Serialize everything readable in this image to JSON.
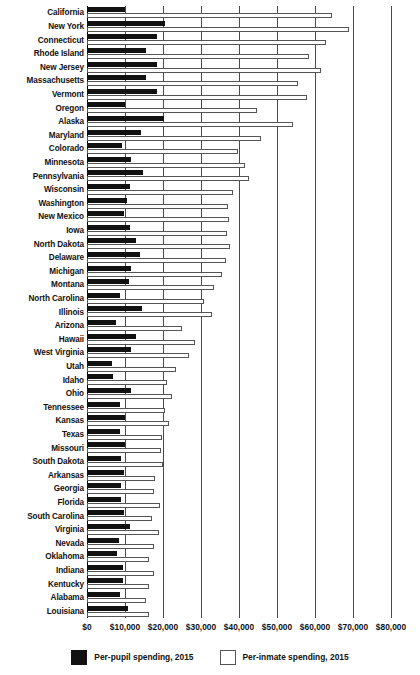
{
  "chart_data": {
    "type": "bar",
    "orientation": "horizontal",
    "title": "",
    "xlabel": "",
    "ylabel": "",
    "xlim": [
      0,
      80000
    ],
    "xticks": [
      0,
      10000,
      20000,
      30000,
      40000,
      50000,
      60000,
      70000,
      80000
    ],
    "xtick_labels": [
      "$0",
      "$10,000",
      "$20,000",
      "$30,000",
      "$40,000",
      "$50,000",
      "$60,000",
      "$70,000",
      "$80,000"
    ],
    "grid": true,
    "legend_position": "bottom",
    "colors": {
      "pupil": "#111111",
      "inmate": "#ffffff",
      "outline": "#555555",
      "grid": "#4a4a4a"
    },
    "series": [
      {
        "name": "Per-pupil spending, 2015",
        "key": "pupil"
      },
      {
        "name": "Per-inmate spending, 2015",
        "key": "inmate"
      }
    ],
    "categories": [
      "California",
      "New York",
      "Connecticut",
      "Rhode Island",
      "New Jersey",
      "Massachusetts",
      "Vermont",
      "Oregon",
      "Alaska",
      "Maryland",
      "Colorado",
      "Minnesota",
      "Pennsylvania",
      "Wisconsin",
      "Washington",
      "New Mexico",
      "Iowa",
      "North Dakota",
      "Delaware",
      "Michigan",
      "Montana",
      "North Carolina",
      "Illinois",
      "Arizona",
      "Hawaii",
      "West Virginia",
      "Utah",
      "Idaho",
      "Ohio",
      "Tennessee",
      "Kansas",
      "Texas",
      "Missouri",
      "South Dakota",
      "Arkansas",
      "Georgia",
      "Florida",
      "South Carolina",
      "Virginia",
      "Nevada",
      "Oklahoma",
      "Indiana",
      "Kentucky",
      "Alabama",
      "Louisiana"
    ],
    "rows": [
      {
        "state": "California",
        "pupil": 10000,
        "inmate": 64600
      },
      {
        "state": "New York",
        "pupil": 20400,
        "inmate": 69000
      },
      {
        "state": "Connecticut",
        "pupil": 18400,
        "inmate": 62800
      },
      {
        "state": "Rhode Island",
        "pupil": 15400,
        "inmate": 58500
      },
      {
        "state": "New Jersey",
        "pupil": 18400,
        "inmate": 61500
      },
      {
        "state": "Massachusetts",
        "pupil": 15600,
        "inmate": 55600
      },
      {
        "state": "Vermont",
        "pupil": 18300,
        "inmate": 57800
      },
      {
        "state": "Oregon",
        "pupil": 10000,
        "inmate": 44700
      },
      {
        "state": "Alaska",
        "pupil": 20200,
        "inmate": 54100
      },
      {
        "state": "Maryland",
        "pupil": 14100,
        "inmate": 45700
      },
      {
        "state": "Colorado",
        "pupil": 9200,
        "inmate": 39700
      },
      {
        "state": "Minnesota",
        "pupil": 11600,
        "inmate": 41700
      },
      {
        "state": "Pennsylvania",
        "pupil": 14700,
        "inmate": 42600
      },
      {
        "state": "Wisconsin",
        "pupil": 11400,
        "inmate": 38400
      },
      {
        "state": "Washington",
        "pupil": 10500,
        "inmate": 37100
      },
      {
        "state": "New Mexico",
        "pupil": 9800,
        "inmate": 37300
      },
      {
        "state": "Iowa",
        "pupil": 11200,
        "inmate": 36900
      },
      {
        "state": "North Dakota",
        "pupil": 13000,
        "inmate": 37500
      },
      {
        "state": "Delaware",
        "pupil": 13900,
        "inmate": 36500
      },
      {
        "state": "Michigan",
        "pupil": 11600,
        "inmate": 35500
      },
      {
        "state": "Montana",
        "pupil": 11000,
        "inmate": 33500
      },
      {
        "state": "North Carolina",
        "pupil": 8800,
        "inmate": 30700
      },
      {
        "state": "Illinois",
        "pupil": 14600,
        "inmate": 32800
      },
      {
        "state": "Arizona",
        "pupil": 7600,
        "inmate": 25100
      },
      {
        "state": "Hawaii",
        "pupil": 13000,
        "inmate": 28300
      },
      {
        "state": "West Virginia",
        "pupil": 11500,
        "inmate": 26900
      },
      {
        "state": "Utah",
        "pupil": 6600,
        "inmate": 23400
      },
      {
        "state": "Idaho",
        "pupil": 6900,
        "inmate": 21100
      },
      {
        "state": "Ohio",
        "pupil": 11600,
        "inmate": 22300
      },
      {
        "state": "Tennessee",
        "pupil": 8700,
        "inmate": 20600
      },
      {
        "state": "Kansas",
        "pupil": 9900,
        "inmate": 21600
      },
      {
        "state": "Texas",
        "pupil": 8700,
        "inmate": 19800
      },
      {
        "state": "Missouri",
        "pupil": 9900,
        "inmate": 19600
      },
      {
        "state": "South Dakota",
        "pupil": 8900,
        "inmate": 20100
      },
      {
        "state": "Arkansas",
        "pupil": 9700,
        "inmate": 18000
      },
      {
        "state": "Georgia",
        "pupil": 9000,
        "inmate": 17700
      },
      {
        "state": "Florida",
        "pupil": 8900,
        "inmate": 19100
      },
      {
        "state": "South Carolina",
        "pupil": 9700,
        "inmate": 17200
      },
      {
        "state": "Virginia",
        "pupil": 11200,
        "inmate": 18900
      },
      {
        "state": "Nevada",
        "pupil": 8400,
        "inmate": 17600
      },
      {
        "state": "Oklahoma",
        "pupil": 8000,
        "inmate": 16300
      },
      {
        "state": "Indiana",
        "pupil": 9600,
        "inmate": 17500
      },
      {
        "state": "Kentucky",
        "pupil": 9400,
        "inmate": 16400
      },
      {
        "state": "Alabama",
        "pupil": 8800,
        "inmate": 15600
      },
      {
        "state": "Louisiana",
        "pupil": 10700,
        "inmate": 16300
      }
    ]
  },
  "legend": {
    "pupil_label": "Per-pupil spending, 2015",
    "inmate_label": "Per-inmate spending, 2015"
  }
}
